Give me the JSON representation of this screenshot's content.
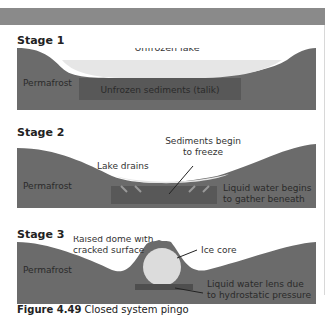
{
  "colors": {
    "ground": "#6b6b6b",
    "talik": "#585858",
    "water": "#e6e6e6",
    "ice": "#dcdcdc",
    "lens": "#4e4e4e",
    "header_bar": "#8a8a8a"
  },
  "stages": [
    {
      "title": "Stage 1",
      "labels": {
        "lake": "Unfrozen lake",
        "permafrost": "Permafrost",
        "talik": "Unfrozen sediments (talik)"
      }
    },
    {
      "title": "Stage 2",
      "labels": {
        "sediments1": "Sediments begin",
        "sediments2": "to freeze",
        "drains": "Lake drains",
        "permafrost": "Permafrost",
        "liquid1": "Liquid water begins",
        "liquid2": "to gather beneath"
      }
    },
    {
      "title": "Stage 3",
      "labels": {
        "dome1": "Raised dome with",
        "dome2": "cracked surface",
        "ice": "Ice core",
        "permafrost": "Permafrost",
        "lens1": "Liquid water lens due",
        "lens2": "to hydrostatic pressure"
      }
    }
  ],
  "caption": {
    "number": "Figure 4.49",
    "text": " Closed system pingo"
  }
}
